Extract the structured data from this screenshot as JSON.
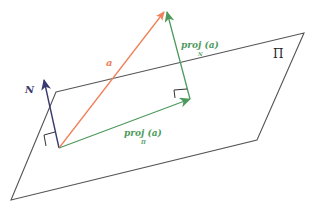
{
  "diagram": {
    "type": "vector projection onto plane",
    "colors": {
      "plane": "#555555",
      "vector_a": "#f0805a",
      "projection": "#4e9a5e",
      "normal": "#3a3a6e",
      "right_angle": "#333333"
    },
    "labels": {
      "plane": "Π",
      "vector_a": "a",
      "normal": "N",
      "proj_normal_main": "proj (a)",
      "proj_normal_sub": "N",
      "proj_plane_main": "proj (a)",
      "proj_plane_sub": "Π"
    }
  }
}
